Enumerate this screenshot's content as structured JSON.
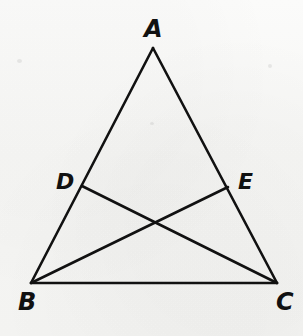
{
  "figure": {
    "kind": "plane-geometry-diagram",
    "caption": "",
    "background_color": "#f7f7f6",
    "stroke_color": "#111111",
    "stroke_width": 2.6,
    "canvas": {
      "width": 303,
      "height": 336
    }
  },
  "labels": {
    "A": "A",
    "B": "B",
    "C": "C",
    "D": "D",
    "E": "E"
  },
  "chart_data": {
    "type": "scatter",
    "title": "",
    "xlabel": "",
    "ylabel": "",
    "grid": false,
    "legend": "none",
    "xlim": [
      0,
      303
    ],
    "ylim": [
      336,
      0
    ],
    "points": [
      {
        "name": "A",
        "x": 153,
        "y": 48,
        "label": "A",
        "label_x": 152,
        "label_y": 28,
        "on": "apex of triangle"
      },
      {
        "name": "B",
        "x": 31,
        "y": 283,
        "label": "B",
        "label_x": 25,
        "label_y": 301,
        "on": "bottom-left vertex"
      },
      {
        "name": "C",
        "x": 277,
        "y": 283,
        "label": "C",
        "label_x": 284,
        "label_y": 301,
        "on": "bottom-right vertex"
      },
      {
        "name": "D",
        "x": 82,
        "y": 186,
        "label": "D",
        "label_x": 64,
        "label_y": 181,
        "on": "segment AB"
      },
      {
        "name": "E",
        "x": 228,
        "y": 187,
        "label": "E",
        "label_x": 246,
        "label_y": 181,
        "on": "segment AC"
      },
      {
        "name": "X",
        "x": 155,
        "y": 221,
        "label": "",
        "label_x": 0,
        "label_y": 0,
        "on": "intersection of DC and EB"
      }
    ],
    "segments": [
      {
        "name": "AB",
        "from": "A",
        "to": "B",
        "x1": 153,
        "y1": 48,
        "x2": 31,
        "y2": 283
      },
      {
        "name": "AC",
        "from": "A",
        "to": "C",
        "x1": 153,
        "y1": 48,
        "x2": 277,
        "y2": 283
      },
      {
        "name": "BC",
        "from": "B",
        "to": "C",
        "x1": 31,
        "y1": 283,
        "x2": 277,
        "y2": 283
      },
      {
        "name": "DC",
        "from": "D",
        "to": "C",
        "x1": 82,
        "y1": 186,
        "x2": 277,
        "y2": 283
      },
      {
        "name": "EB",
        "from": "E",
        "to": "B",
        "x1": 228,
        "y1": 187,
        "x2": 31,
        "y2": 283
      }
    ]
  }
}
